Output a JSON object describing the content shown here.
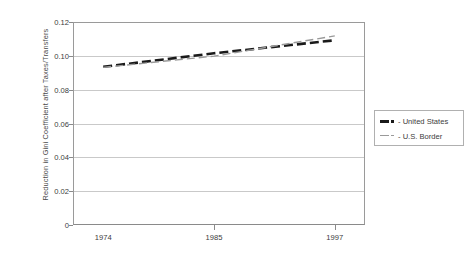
{
  "chart_data": {
    "type": "line",
    "title": "",
    "xlabel": "",
    "ylabel": "Reduction in Gini Coefficient after Taxes/Transfers",
    "x": [
      1974,
      1985,
      1997
    ],
    "xtick_labels": [
      "1974",
      "1985",
      "1997"
    ],
    "ytick_labels": [
      "0",
      "0.02",
      "0.04",
      "0.06",
      "0.08",
      "0.10",
      "0.12"
    ],
    "ytick_values": [
      0,
      0.02,
      0.04,
      0.06,
      0.08,
      0.1,
      0.12
    ],
    "ylim": [
      0,
      0.12
    ],
    "xlim": [
      1971,
      2000
    ],
    "grid": "horizontal",
    "legend_position": "right",
    "series": [
      {
        "name": "United States",
        "color": "#1a1a1a",
        "style": "dashed",
        "width": "thick",
        "values": [
          0.0935,
          0.1015,
          0.1092
        ]
      },
      {
        "name": "U.S. Border",
        "color": "#9a9a9a",
        "style": "dashed",
        "width": "thin",
        "values": [
          0.0932,
          0.0998,
          0.1118
        ]
      }
    ]
  },
  "legend": {
    "items": [
      {
        "label": "- United States",
        "swatch": "thick-dashed-black"
      },
      {
        "label": "- U.S. Border",
        "swatch": "thin-dashed-gray"
      }
    ]
  },
  "colors": {
    "background": "#ffffff",
    "gridline": "#c9c9c9",
    "axis": "#8a8a8a",
    "series_primary": "#1a1a1a",
    "series_secondary": "#9a9a9a",
    "text": "#3c3c3c"
  }
}
